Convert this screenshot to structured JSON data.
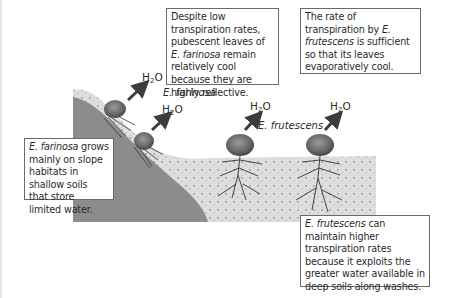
{
  "diagram": {
    "title": "",
    "boxes": {
      "farinosa_reflective": {
        "text_pre": "Despite low transpiration rates, pubescent leaves of ",
        "species": "E. farinosa",
        "text_post": " remain relatively cool because they are highly reflective."
      },
      "frutescens_rate": {
        "text_pre": "The rate of transpiration by ",
        "species": "E. frutescens",
        "text_post": " is sufficient so that its leaves evaporatively cool."
      },
      "farinosa_habitat": {
        "species": "E. farinosa",
        "text_post": " grows mainly on slope habitats in shallow soils that store limited water."
      },
      "frutescens_water": {
        "species": "E. frutescens",
        "text_post": " can maintain higher transpiration rates because it exploits the greater water available in deep soils along washes."
      }
    },
    "water_labels": [
      {
        "base": "H",
        "sub": "2",
        "rest": "O"
      },
      {
        "base": "H",
        "sub": "2",
        "rest": "O"
      },
      {
        "base": "H",
        "sub": "2",
        "rest": "O"
      },
      {
        "base": "H",
        "sub": "2",
        "rest": "O"
      }
    ],
    "species_labels": {
      "farinosa": "E. farinosa",
      "frutescens": "E. frutescens"
    },
    "colors": {
      "bedrock": "#8c8c8c",
      "soil": "#dcdcdc",
      "shrub": "#6e6e6e",
      "arrow": "#3c3c3c",
      "border": "#6a6a6a"
    }
  }
}
